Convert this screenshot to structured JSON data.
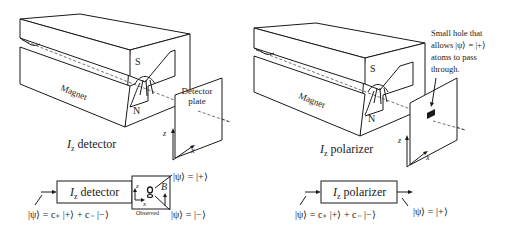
{
  "left": {
    "magnet_label": "Magnet",
    "pole_south": "S",
    "pole_north": "N",
    "plate_label_line1": "Detector",
    "plate_label_line2": "plate",
    "axis_z": "z",
    "axis_x": "x",
    "caption_italic": "I",
    "caption_sub": "z",
    "caption_rest": " detector",
    "schematic": {
      "box_italic": "I",
      "box_sub": "z",
      "box_rest": " detector",
      "input_state": "|ψ⟩ = c₊ |+⟩ + c₋ |−⟩",
      "output_plus": "|ψ⟩ = |+⟩",
      "output_minus": "|ψ⟩ = |−⟩",
      "observed_label": "Observed",
      "field_label": "B",
      "axis_z": "z",
      "axis_x": "x"
    }
  },
  "right": {
    "magnet_label": "Magnet",
    "pole_south": "S",
    "pole_north": "N",
    "hole_note_line1": "Small hole that",
    "hole_note_line2": "allows |ψ⟩ = |+⟩",
    "hole_note_line3": "atoms to pass",
    "hole_note_line4": "through.",
    "axis_z": "z",
    "axis_x": "x",
    "caption_italic": "I",
    "caption_sub": "z",
    "caption_rest": " polarizer",
    "schematic": {
      "box_italic": "I",
      "box_sub": "z",
      "box_rest": " polarizer",
      "input_state": "|ψ⟩ = c₊ |+⟩ + c₋ |−⟩",
      "output_state": "|ψ⟩ = |+⟩"
    }
  }
}
